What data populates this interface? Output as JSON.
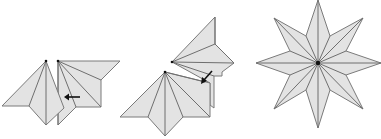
{
  "diagram": {
    "colors": {
      "paper_fill": "#e3e3e3",
      "edge": "#7a7a7a",
      "arrow": "#111111",
      "background": "#ffffff"
    },
    "steps": [
      {
        "id": "step-1",
        "label": "",
        "arrow_direction": "left",
        "description": "Two fan units placed side by side; arrow indicates sliding the right unit into the left"
      },
      {
        "id": "step-2",
        "label": "",
        "arrow_direction": "down-left",
        "description": "Next unit inserted at an angle; arrow indicates diagonal insertion"
      },
      {
        "id": "step-3",
        "label": "",
        "arrow_direction": "none",
        "description": "Completed eight-pointed star with sixteen radial creases meeting at the center"
      }
    ]
  }
}
